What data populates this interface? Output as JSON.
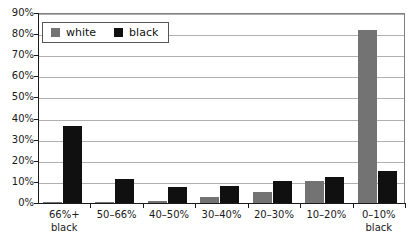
{
  "chart_data": {
    "type": "bar",
    "title": "",
    "xlabel": "",
    "ylabel": "",
    "ylim": [
      0,
      90
    ],
    "ytick_labels": [
      "90%",
      "80%",
      "70%",
      "60%",
      "50%",
      "40%",
      "30%",
      "20%",
      "10%",
      "0%"
    ],
    "ytick_values": [
      90,
      80,
      70,
      60,
      50,
      40,
      30,
      20,
      10,
      0
    ],
    "grid": true,
    "legend_position": "top-left inside plot",
    "categories": [
      "66%+ black",
      "50–66%",
      "40–50%",
      "30–40%",
      "20–30%",
      "10–20%",
      "0–10% black"
    ],
    "category_lines": [
      [
        "66%+",
        "black"
      ],
      [
        "50–66%",
        ""
      ],
      [
        "40–50%",
        ""
      ],
      [
        "30–40%",
        ""
      ],
      [
        "20–30%",
        ""
      ],
      [
        "10–20%",
        ""
      ],
      [
        "0–10%",
        "black"
      ]
    ],
    "series": [
      {
        "name": "white",
        "color": "#737373",
        "values": [
          0.3,
          0.7,
          1.0,
          3.0,
          5.0,
          10.5,
          82.0
        ]
      },
      {
        "name": "black",
        "color": "#101010",
        "values": [
          36.5,
          11.5,
          7.5,
          8.0,
          10.5,
          12.5,
          15.0
        ]
      }
    ]
  },
  "legend": {
    "items": [
      {
        "label": "white",
        "swatch": "gray-square-swatch"
      },
      {
        "label": "black",
        "swatch": "black-square-swatch"
      }
    ]
  }
}
